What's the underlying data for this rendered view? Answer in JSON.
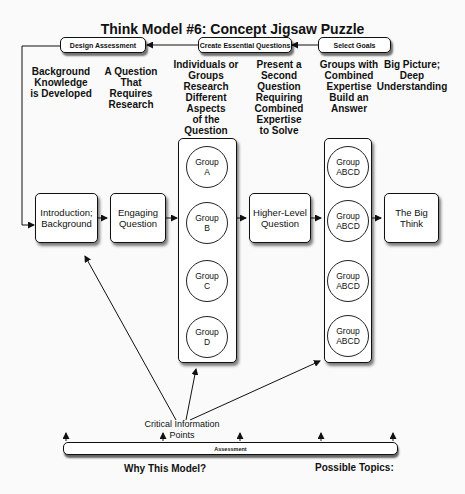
{
  "title": "Think Model #6: Concept Jigsaw Puzzle",
  "header_steps": [
    {
      "label": "Design Assessment"
    },
    {
      "label": "Create Essential Questions"
    },
    {
      "label": "Select Goals"
    }
  ],
  "captions": [
    "Background Knowledge is Developed",
    "A Question That Requires Research",
    "Individuals or Groups Research Different Aspects of the Question",
    "Present a Second Question Requiring Combined Expertise to Solve",
    "Groups with Combined Expertise Build an Answer",
    "Big Picture; Deep Understanding"
  ],
  "caption_lines": {
    "c0": [
      "Background",
      "Knowledge",
      "is Developed"
    ],
    "c1": [
      "A Question",
      "That",
      "Requires",
      "Research"
    ],
    "c2": [
      "Individuals or",
      "Groups",
      "Research",
      "Different",
      "Aspects",
      "of the",
      "Question"
    ],
    "c3": [
      "Present a",
      "Second",
      "Question",
      "Requiring",
      "Combined",
      "Expertise",
      "to Solve"
    ],
    "c4": [
      "Groups with",
      "Combined",
      "Expertise",
      "Build an",
      "Answer"
    ],
    "c5": [
      "Big Picture;",
      "Deep",
      "Understanding"
    ]
  },
  "flow_boxes": {
    "intro": {
      "line1": "Introduction;",
      "line2": "Background"
    },
    "engaging": {
      "line1": "Engaging",
      "line2": "Question"
    },
    "higher": {
      "line1": "Higher-Level",
      "line2": "Question"
    },
    "bigthink": {
      "line1": "The Big",
      "line2": "Think"
    }
  },
  "research_groups": [
    {
      "line1": "Group",
      "line2": "A"
    },
    {
      "line1": "Group",
      "line2": "B"
    },
    {
      "line1": "Group",
      "line2": "C"
    },
    {
      "line1": "Group",
      "line2": "D"
    }
  ],
  "combined_groups": [
    {
      "line1": "Group",
      "line2": "ABCD"
    },
    {
      "line1": "Group",
      "line2": "ABCD"
    },
    {
      "line1": "Group",
      "line2": "ABCD"
    },
    {
      "line1": "Group",
      "line2": "ABCD"
    }
  ],
  "critical_info": {
    "line1": "Critical Information",
    "line2": "Points"
  },
  "assessment_bar": {
    "label": "Assessment"
  },
  "footer": {
    "left": "Why This Model?",
    "right": "Possible Topics:"
  }
}
